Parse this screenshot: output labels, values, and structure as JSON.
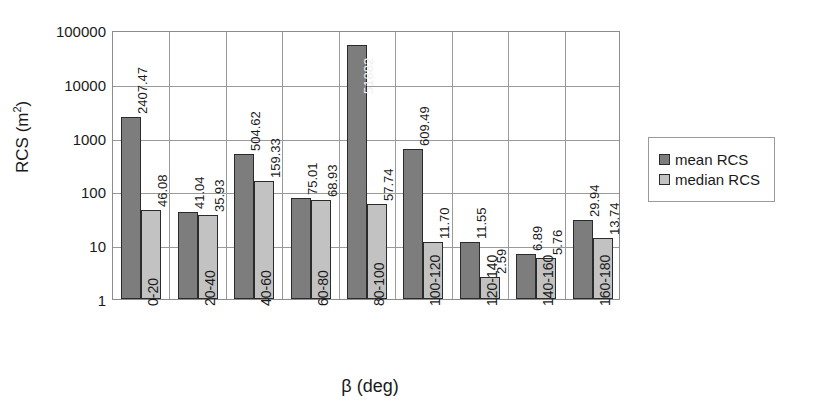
{
  "chart_data": {
    "type": "bar",
    "title": "",
    "xlabel": "β (deg)",
    "ylabel": "RCS (m²)",
    "yscale": "log",
    "ylim": [
      1,
      100000
    ],
    "ytick_labels": [
      "100000",
      "10000",
      "1000",
      "100",
      "10",
      "1"
    ],
    "grid": true,
    "legend_position": "right",
    "categories": [
      "0-20",
      "20-40",
      "40-60",
      "60-80",
      "80-100",
      "100-120",
      "120-140",
      "140-160",
      "160-180"
    ],
    "series": [
      {
        "name": "mean RCS",
        "color": "#7d7d7d",
        "values": [
          2407.47,
          41.04,
          504.62,
          75.01,
          51882,
          609.49,
          11.55,
          6.89,
          29.94
        ],
        "labels": [
          "2407.47",
          "41.04",
          "504.62",
          "75.01",
          "51882",
          "609.49",
          "11.55",
          "6.89",
          "29.94"
        ]
      },
      {
        "name": "median RCS",
        "color": "#c2c2c2",
        "values": [
          46.08,
          35.93,
          159.33,
          68.93,
          57.74,
          11.7,
          2.59,
          5.76,
          13.74
        ],
        "labels": [
          "46.08",
          "35.93",
          "159.33",
          "68.93",
          "57.74",
          "11.70",
          "2.59",
          "5.76",
          "13.74"
        ]
      }
    ]
  },
  "legend": {
    "items": [
      {
        "label": "mean RCS",
        "key": "mean"
      },
      {
        "label": "median RCS",
        "key": "median"
      }
    ]
  },
  "axes": {
    "x_title": "β (deg)",
    "y_title_text": "RCS (m",
    "y_title_sup": "2",
    "y_title_tail": ")"
  }
}
